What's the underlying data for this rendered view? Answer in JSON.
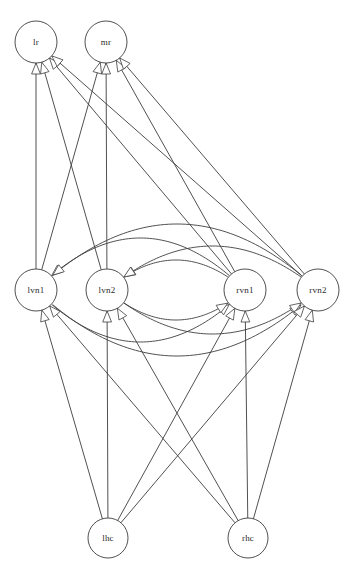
{
  "diagram": {
    "title": "",
    "type": "directed-graph",
    "background_color": "#ffffff",
    "edge_color": "#3d3d3d",
    "node_fill": "#ffffff",
    "node_stroke": "#3d3d3d",
    "label_color": "#2a2a2a",
    "node_radius": 21,
    "arrow_style": "open-triangle"
  },
  "nodes": [
    {
      "id": "lr",
      "label": "lr",
      "x": 36,
      "y": 42,
      "r": 21,
      "layer": "top"
    },
    {
      "id": "mr",
      "label": "mr",
      "x": 106,
      "y": 42,
      "r": 21,
      "layer": "top"
    },
    {
      "id": "lvn1",
      "label": "lvn1",
      "x": 36,
      "y": 290,
      "r": 21,
      "layer": "middle"
    },
    {
      "id": "lvn2",
      "label": "lvn2",
      "x": 107,
      "y": 290,
      "r": 21,
      "layer": "middle"
    },
    {
      "id": "rvn1",
      "label": "rvn1",
      "x": 245,
      "y": 290,
      "r": 21,
      "layer": "middle"
    },
    {
      "id": "rvn2",
      "label": "rvn2",
      "x": 318,
      "y": 290,
      "r": 21,
      "layer": "middle"
    },
    {
      "id": "lhc",
      "label": "lhc",
      "x": 108,
      "y": 538,
      "r": 20,
      "layer": "bottom"
    },
    {
      "id": "rhc",
      "label": "rhc",
      "x": 248,
      "y": 538,
      "r": 20,
      "layer": "bottom"
    }
  ],
  "edges": [
    {
      "from": "lvn1",
      "to": "lr",
      "shape": "straight"
    },
    {
      "from": "lvn2",
      "to": "lr",
      "shape": "straight"
    },
    {
      "from": "rvn1",
      "to": "lr",
      "shape": "straight"
    },
    {
      "from": "rvn2",
      "to": "lr",
      "shape": "straight"
    },
    {
      "from": "lvn1",
      "to": "mr",
      "shape": "straight"
    },
    {
      "from": "lvn2",
      "to": "mr",
      "shape": "straight"
    },
    {
      "from": "rvn1",
      "to": "mr",
      "shape": "straight"
    },
    {
      "from": "rvn2",
      "to": "mr",
      "shape": "straight"
    },
    {
      "from": "rvn1",
      "to": "lvn1",
      "shape": "arc-above",
      "bow": 52
    },
    {
      "from": "rvn2",
      "to": "lvn1",
      "shape": "arc-above",
      "bow": 66
    },
    {
      "from": "rvn1",
      "to": "lvn2",
      "shape": "arc-above",
      "bow": 30
    },
    {
      "from": "rvn2",
      "to": "lvn2",
      "shape": "arc-above",
      "bow": 44
    },
    {
      "from": "lvn1",
      "to": "rvn1",
      "shape": "arc-below",
      "bow": 52
    },
    {
      "from": "lvn1",
      "to": "rvn2",
      "shape": "arc-below",
      "bow": 66
    },
    {
      "from": "lvn2",
      "to": "rvn1",
      "shape": "arc-below",
      "bow": 30
    },
    {
      "from": "lvn2",
      "to": "rvn2",
      "shape": "arc-below",
      "bow": 44
    },
    {
      "from": "lhc",
      "to": "lvn1",
      "shape": "straight"
    },
    {
      "from": "lhc",
      "to": "lvn2",
      "shape": "straight"
    },
    {
      "from": "lhc",
      "to": "rvn1",
      "shape": "straight"
    },
    {
      "from": "lhc",
      "to": "rvn2",
      "shape": "straight"
    },
    {
      "from": "rhc",
      "to": "lvn1",
      "shape": "straight"
    },
    {
      "from": "rhc",
      "to": "lvn2",
      "shape": "straight"
    },
    {
      "from": "rhc",
      "to": "rvn1",
      "shape": "straight"
    },
    {
      "from": "rhc",
      "to": "rvn2",
      "shape": "straight"
    }
  ]
}
